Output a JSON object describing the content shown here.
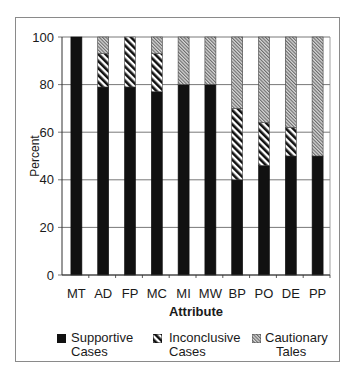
{
  "chart_data": {
    "type": "bar",
    "stacked": true,
    "title": "",
    "xlabel": "Attribute",
    "ylabel": "Percent",
    "ylim": [
      0,
      100
    ],
    "yticks": [
      0,
      20,
      40,
      60,
      80,
      100
    ],
    "grid": true,
    "legend_position": "bottom",
    "categories": [
      "MT",
      "AD",
      "FP",
      "MC",
      "MI",
      "MW",
      "BP",
      "PO",
      "DE",
      "PP"
    ],
    "series": [
      {
        "name": "Supportive Cases",
        "pattern": "solid",
        "color": "#111111",
        "values": [
          100,
          79,
          79,
          77,
          80,
          80,
          40,
          46,
          50,
          50
        ]
      },
      {
        "name": "Inconclusive Cases",
        "pattern": "diagonal-hatch",
        "color": "#222222",
        "values": [
          0,
          14,
          21,
          16,
          0,
          0,
          30,
          18,
          12,
          0
        ]
      },
      {
        "name": "Cautionary Tales",
        "pattern": "fine-hatch",
        "color": "#888888",
        "values": [
          0,
          7,
          0,
          7,
          20,
          20,
          30,
          36,
          38,
          50
        ]
      }
    ]
  },
  "legend": {
    "items": [
      {
        "line1": "Supportive",
        "line2": "Cases"
      },
      {
        "line1": "Inconclusive",
        "line2": "Cases"
      },
      {
        "line1": "Cautionary",
        "line2": "Tales"
      }
    ]
  },
  "axis": {
    "x_title": "Attribute",
    "y_title": "Percent"
  }
}
